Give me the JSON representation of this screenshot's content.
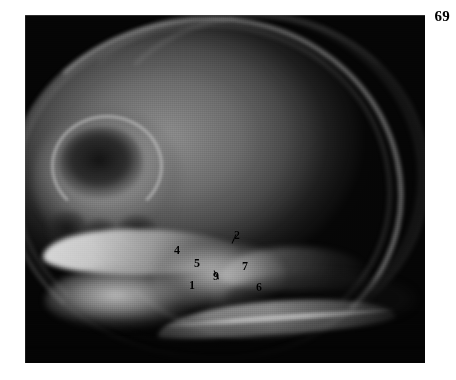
{
  "figure": {
    "page_number": "69",
    "modality": "lateral skull radiograph",
    "caption": ""
  },
  "labels": [
    {
      "id": "label-1",
      "text": "1",
      "x": 192,
      "y": 285
    },
    {
      "id": "label-2",
      "text": "2",
      "x": 237,
      "y": 235
    },
    {
      "id": "label-4",
      "text": "4",
      "x": 177,
      "y": 250
    },
    {
      "id": "label-5",
      "text": "5",
      "x": 197,
      "y": 263
    },
    {
      "id": "label-6",
      "text": "6",
      "x": 259,
      "y": 287
    },
    {
      "id": "label-7",
      "text": "7",
      "x": 245,
      "y": 266
    },
    {
      "id": "label-9",
      "text": "9",
      "x": 216,
      "y": 276
    }
  ],
  "leaders": [
    {
      "id": "leader-2",
      "x": 232,
      "y": 243,
      "length": 10,
      "angle": 66
    },
    {
      "id": "leader-9",
      "x": 214,
      "y": 270,
      "length": 10,
      "angle": -62
    }
  ],
  "colors": {
    "page_background": "#ffffff",
    "plate_background": "#050505",
    "label_text": "#000000"
  }
}
